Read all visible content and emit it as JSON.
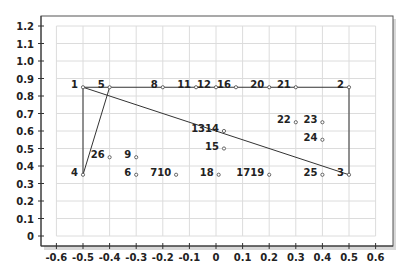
{
  "chart_data": {
    "type": "scatter",
    "title": "",
    "xlabel": "",
    "ylabel": "",
    "xlim": [
      -0.6,
      0.6
    ],
    "ylim": [
      0,
      1.2
    ],
    "grid": true,
    "legend": null,
    "x_ticks": [
      "-0.6",
      "-0.5",
      "-0.4",
      "-0.3",
      "-0.2",
      "-0.1",
      "0",
      "0.1",
      "0.2",
      "0.3",
      "0.4",
      "0.5",
      "0.6"
    ],
    "y_ticks": [
      "0",
      "0.1",
      "0.2",
      "0.3",
      "0.4",
      "0.5",
      "0.6",
      "0.7",
      "0.8",
      "0.9",
      "1.0",
      "1.1",
      "1.2"
    ],
    "points": [
      {
        "label": "1",
        "x": -0.5,
        "y": 0.85,
        "label_pos": "left"
      },
      {
        "label": "2",
        "x": 0.5,
        "y": 0.85,
        "label_pos": "left"
      },
      {
        "label": "3",
        "x": 0.5,
        "y": 0.35,
        "label_pos": "left"
      },
      {
        "label": "4",
        "x": -0.5,
        "y": 0.35,
        "label_pos": "left"
      },
      {
        "label": "5",
        "x": -0.4,
        "y": 0.85,
        "label_pos": "left"
      },
      {
        "label": "8",
        "x": -0.2,
        "y": 0.85,
        "label_pos": "left"
      },
      {
        "label": "11",
        "x": -0.075,
        "y": 0.85,
        "label_pos": "left"
      },
      {
        "label": "12",
        "x": 0.0,
        "y": 0.85,
        "label_pos": "left"
      },
      {
        "label": "16",
        "x": 0.075,
        "y": 0.85,
        "label_pos": "left"
      },
      {
        "label": "20",
        "x": 0.2,
        "y": 0.85,
        "label_pos": "left"
      },
      {
        "label": "21",
        "x": 0.3,
        "y": 0.85,
        "label_pos": "left"
      },
      {
        "label": "1314",
        "x": 0.03,
        "y": 0.6,
        "label_pos": "left"
      },
      {
        "label": "15",
        "x": 0.03,
        "y": 0.5,
        "label_pos": "left"
      },
      {
        "label": "22",
        "x": 0.3,
        "y": 0.65,
        "label_pos": "left"
      },
      {
        "label": "23",
        "x": 0.4,
        "y": 0.65,
        "label_pos": "left"
      },
      {
        "label": "24",
        "x": 0.4,
        "y": 0.55,
        "label_pos": "left"
      },
      {
        "label": "26",
        "x": -0.4,
        "y": 0.45,
        "label_pos": "left"
      },
      {
        "label": "9",
        "x": -0.3,
        "y": 0.45,
        "label_pos": "left"
      },
      {
        "label": "6",
        "x": -0.3,
        "y": 0.35,
        "label_pos": "left"
      },
      {
        "label": "710",
        "x": -0.15,
        "y": 0.35,
        "label_pos": "left"
      },
      {
        "label": "18",
        "x": 0.01,
        "y": 0.35,
        "label_pos": "left"
      },
      {
        "label": "1719",
        "x": 0.2,
        "y": 0.35,
        "label_pos": "left"
      },
      {
        "label": "25",
        "x": 0.4,
        "y": 0.35,
        "label_pos": "left"
      }
    ],
    "lines": [
      {
        "from": "1",
        "to": "2"
      },
      {
        "from": "2",
        "to": "3"
      },
      {
        "from": "1",
        "to": "3"
      },
      {
        "from": "1",
        "to": "4"
      },
      {
        "from": "4",
        "to": "5"
      }
    ]
  }
}
